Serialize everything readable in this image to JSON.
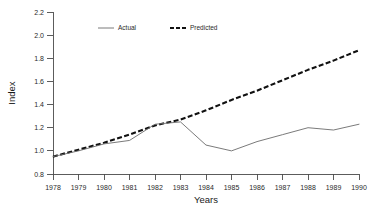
{
  "chart_data": {
    "type": "line",
    "title": "",
    "xlabel": "Years",
    "ylabel": "Index",
    "x": [
      1978,
      1979,
      1980,
      1981,
      1982,
      1983,
      1984,
      1985,
      1986,
      1987,
      1988,
      1989,
      1990
    ],
    "xtick_labels": [
      "1978",
      "1979",
      "1980",
      "1981",
      "1982",
      "1983",
      "1984",
      "1985",
      "1986",
      "1987",
      "1988",
      "1989",
      "1990"
    ],
    "ytick_labels": [
      "0.8",
      "1.0",
      "1.2",
      "1.4",
      "1.6",
      "1.8",
      "2.0",
      "2.2"
    ],
    "yticks": [
      0.8,
      1.0,
      1.2,
      1.4,
      1.6,
      1.8,
      2.0,
      2.2
    ],
    "ylim": [
      0.8,
      2.2
    ],
    "xlim": [
      1978,
      1990
    ],
    "grid": false,
    "legend_position": "top-left-inside",
    "series": [
      {
        "name": "Actual",
        "style": "solid",
        "color": "#6b6b6b",
        "values": [
          0.95,
          1.0,
          1.06,
          1.09,
          1.23,
          1.25,
          1.05,
          1.0,
          1.08,
          1.14,
          1.2,
          1.18,
          1.23
        ]
      },
      {
        "name": "Predicted",
        "style": "dashed",
        "color": "#111111",
        "values": [
          0.95,
          1.01,
          1.07,
          1.14,
          1.22,
          1.27,
          1.35,
          1.44,
          1.52,
          1.61,
          1.7,
          1.78,
          1.87
        ]
      }
    ],
    "legend": [
      {
        "label": "Actual",
        "style": "solid",
        "color": "#6b6b6b"
      },
      {
        "label": "Predicted",
        "style": "dashed",
        "color": "#111111"
      }
    ]
  }
}
